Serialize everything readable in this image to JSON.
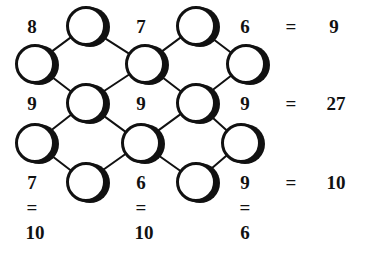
{
  "puzzle": {
    "type": "diamond-lattice-number-puzzle",
    "colors": {
      "ink": "#111111",
      "background": "#ffffff",
      "circle_fill": "#ffffff",
      "circle_stroke": "#111111",
      "shadow": "#111111"
    },
    "geometry": {
      "width": 366,
      "height": 256,
      "circle_radius": 20,
      "circle_stroke_width": 3,
      "shadow_offset_x": 4,
      "edge_stroke_width": 2
    },
    "nodes": [
      {
        "id": "n1",
        "x": 86,
        "y": 26,
        "value": ""
      },
      {
        "id": "n2",
        "x": 196,
        "y": 26,
        "value": ""
      },
      {
        "id": "n3",
        "x": 35,
        "y": 64,
        "value": ""
      },
      {
        "id": "n4",
        "x": 145,
        "y": 64,
        "value": ""
      },
      {
        "id": "n5",
        "x": 246,
        "y": 64,
        "value": ""
      },
      {
        "id": "n6",
        "x": 86,
        "y": 103,
        "value": ""
      },
      {
        "id": "n7",
        "x": 196,
        "y": 103,
        "value": ""
      },
      {
        "id": "n8",
        "x": 35,
        "y": 143,
        "value": ""
      },
      {
        "id": "n9",
        "x": 141,
        "y": 143,
        "value": ""
      },
      {
        "id": "n10",
        "x": 241,
        "y": 143,
        "value": ""
      },
      {
        "id": "n11",
        "x": 86,
        "y": 182,
        "value": ""
      },
      {
        "id": "n12",
        "x": 196,
        "y": 182,
        "value": ""
      }
    ],
    "edges": [
      {
        "from": "n1",
        "to": "n3"
      },
      {
        "from": "n1",
        "to": "n4"
      },
      {
        "from": "n2",
        "to": "n4"
      },
      {
        "from": "n2",
        "to": "n5"
      },
      {
        "from": "n3",
        "to": "n6"
      },
      {
        "from": "n4",
        "to": "n6"
      },
      {
        "from": "n4",
        "to": "n7"
      },
      {
        "from": "n5",
        "to": "n7"
      },
      {
        "from": "n6",
        "to": "n8"
      },
      {
        "from": "n6",
        "to": "n9"
      },
      {
        "from": "n7",
        "to": "n9"
      },
      {
        "from": "n7",
        "to": "n10"
      },
      {
        "from": "n8",
        "to": "n11"
      },
      {
        "from": "n9",
        "to": "n11"
      },
      {
        "from": "n9",
        "to": "n12"
      },
      {
        "from": "n10",
        "to": "n12"
      }
    ],
    "clues": [
      {
        "id": "c1",
        "label": "8",
        "x": 32,
        "y": 26
      },
      {
        "id": "c2",
        "label": "7",
        "x": 141,
        "y": 26
      },
      {
        "id": "c3",
        "label": "6",
        "x": 245,
        "y": 26
      },
      {
        "id": "c4",
        "label": "9",
        "x": 32,
        "y": 103
      },
      {
        "id": "c5",
        "label": "9",
        "x": 141,
        "y": 103
      },
      {
        "id": "c6",
        "label": "9",
        "x": 245,
        "y": 103
      },
      {
        "id": "c7",
        "label": "7",
        "x": 32,
        "y": 182
      },
      {
        "id": "c8",
        "label": "6",
        "x": 141,
        "y": 182
      },
      {
        "id": "c9",
        "label": "9",
        "x": 245,
        "y": 182
      }
    ],
    "row_equations": [
      {
        "id": "r1",
        "equals": "=",
        "eq_x": 291,
        "eq_y": 26,
        "sum": "9",
        "sum_x": 334,
        "sum_y": 26
      },
      {
        "id": "r2",
        "equals": "=",
        "eq_x": 291,
        "eq_y": 103,
        "sum": "27",
        "sum_x": 336,
        "sum_y": 103
      },
      {
        "id": "r3",
        "equals": "=",
        "eq_x": 291,
        "eq_y": 182,
        "sum": "10",
        "sum_x": 336,
        "sum_y": 182
      }
    ],
    "column_equations": [
      {
        "id": "k1",
        "equals": "=",
        "eq_x": 32,
        "eq_y": 207,
        "sum": "10",
        "sum_x": 35,
        "sum_y": 232
      },
      {
        "id": "k2",
        "equals": "=",
        "eq_x": 141,
        "eq_y": 207,
        "sum": "10",
        "sum_x": 144,
        "sum_y": 232
      },
      {
        "id": "k3",
        "equals": "=",
        "eq_x": 245,
        "eq_y": 207,
        "sum": "6",
        "sum_x": 245,
        "sum_y": 232
      }
    ]
  }
}
